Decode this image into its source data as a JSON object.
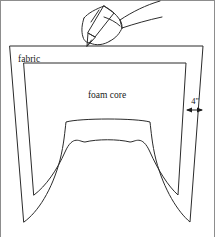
{
  "figure": {
    "type": "technical-line-diagram",
    "background_color": "#ffffff",
    "line_color": "#2b2b2b",
    "labels": {
      "fabric": "fabric",
      "foam_core": "foam core",
      "allowance": "4\""
    },
    "label_positions": {
      "fabric": {
        "x": 18,
        "y": 60
      },
      "foam_core": {
        "x": 107,
        "y": 98
      },
      "allowance": {
        "x": 195,
        "y": 103
      }
    },
    "elements": [
      {
        "name": "hand-with-pencil",
        "description": "line drawing of a hand holding a pencil, tip touching the top edge of the fabric"
      },
      {
        "name": "fabric-outline",
        "description": "outer quadrilateral with flared sides and an arch cutout at the bottom center"
      },
      {
        "name": "foam-core-outline",
        "description": "inner quadrilateral offset inward, with its own arch cutout at the bottom center"
      },
      {
        "name": "allowance-dimension",
        "description": "double headed horizontal arrow between the foam core right edge and the fabric right edge"
      }
    ],
    "geometry": {
      "fabric": {
        "top_left": {
          "x": 10,
          "y": 46
        },
        "top_right": {
          "x": 203,
          "y": 46
        },
        "bottom_left": {
          "x": 24,
          "y": 222
        },
        "bottom_right": {
          "x": 190,
          "y": 222
        },
        "arch_left": {
          "x": 66,
          "y": 122
        },
        "arch_right": {
          "x": 150,
          "y": 122
        }
      },
      "foam_core": {
        "top_left": {
          "x": 24,
          "y": 63
        },
        "top_right": {
          "x": 186,
          "y": 63
        },
        "bottom_left": {
          "x": 34,
          "y": 195
        },
        "bottom_right": {
          "x": 178,
          "y": 195
        },
        "arch_left": {
          "x": 85,
          "y": 142
        },
        "arch_right": {
          "x": 130,
          "y": 142
        }
      },
      "dimension_line": {
        "y": 110,
        "x_start": 186,
        "x_end": 203
      }
    },
    "frame": {
      "visible_sides": [
        "top",
        "left",
        "right"
      ],
      "color": "#8d8d8d"
    }
  }
}
